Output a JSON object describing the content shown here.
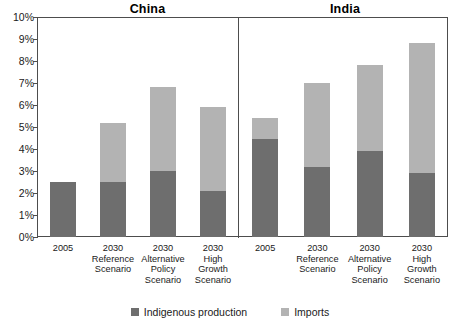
{
  "chart_data": {
    "type": "bar",
    "stacked": true,
    "title": "",
    "xlabel": "",
    "ylabel": "",
    "ylim": [
      0,
      10
    ],
    "ytick_labels": [
      "0%",
      "1%",
      "2%",
      "3%",
      "4%",
      "5%",
      "6%",
      "7%",
      "8%",
      "9%",
      "10%"
    ],
    "ytick_values": [
      0,
      1,
      2,
      3,
      4,
      5,
      6,
      7,
      8,
      9,
      10
    ],
    "grid": false,
    "legend_position": "bottom",
    "series": [
      {
        "name": "Indigenous production",
        "color": "#6e6e6e"
      },
      {
        "name": "Imports",
        "color": "#b3b3b3"
      }
    ],
    "panels": [
      {
        "name": "China",
        "categories": [
          {
            "year": "2005",
            "scenario": ""
          },
          {
            "year": "2030",
            "scenario": "Reference Scenario"
          },
          {
            "year": "2030",
            "scenario": "Alternative Policy Scenario"
          },
          {
            "year": "2030",
            "scenario": "High Growth Scenario"
          }
        ],
        "values": {
          "Indigenous production": [
            2.5,
            2.5,
            3.0,
            2.1
          ],
          "Imports": [
            0.0,
            2.7,
            3.8,
            3.8
          ]
        },
        "totals": [
          2.5,
          5.2,
          6.8,
          5.9
        ]
      },
      {
        "name": "India",
        "categories": [
          {
            "year": "2005",
            "scenario": ""
          },
          {
            "year": "2030",
            "scenario": "Reference Scenario"
          },
          {
            "year": "2030",
            "scenario": "Alternative Policy Scenario"
          },
          {
            "year": "2030",
            "scenario": "High Growth Scenario"
          }
        ],
        "values": {
          "Indigenous production": [
            4.45,
            3.2,
            3.9,
            2.9
          ],
          "Imports": [
            0.95,
            3.8,
            3.9,
            5.9
          ]
        },
        "totals": [
          5.4,
          7.0,
          7.8,
          8.8
        ]
      }
    ]
  },
  "panels": {
    "china": {
      "title": "China"
    },
    "india": {
      "title": "India"
    }
  },
  "yaxis": {
    "t10": "10%",
    "t9": "9%",
    "t8": "8%",
    "t7": "7%",
    "t6": "6%",
    "t5": "5%",
    "t4": "4%",
    "t3": "3%",
    "t2": "2%",
    "t1": "1%",
    "t0": "0%"
  },
  "xaxis": {
    "china": [
      {
        "year": "2005",
        "scenario": ""
      },
      {
        "year": "2030",
        "scenario": "Reference\nScenario"
      },
      {
        "year": "2030",
        "scenario": "Alternative\nPolicy\nScenario"
      },
      {
        "year": "2030",
        "scenario": "High\nGrowth\nScenario"
      }
    ],
    "india": [
      {
        "year": "2005",
        "scenario": ""
      },
      {
        "year": "2030",
        "scenario": "Reference\nScenario"
      },
      {
        "year": "2030",
        "scenario": "Alternative\nPolicy\nScenario"
      },
      {
        "year": "2030",
        "scenario": "High\nGrowth\nScenario"
      }
    ]
  },
  "legend": {
    "indigenous_label": "Indigenous production",
    "imports_label": "Imports",
    "indigenous_color": "#6e6e6e",
    "imports_color": "#b3b3b3"
  }
}
